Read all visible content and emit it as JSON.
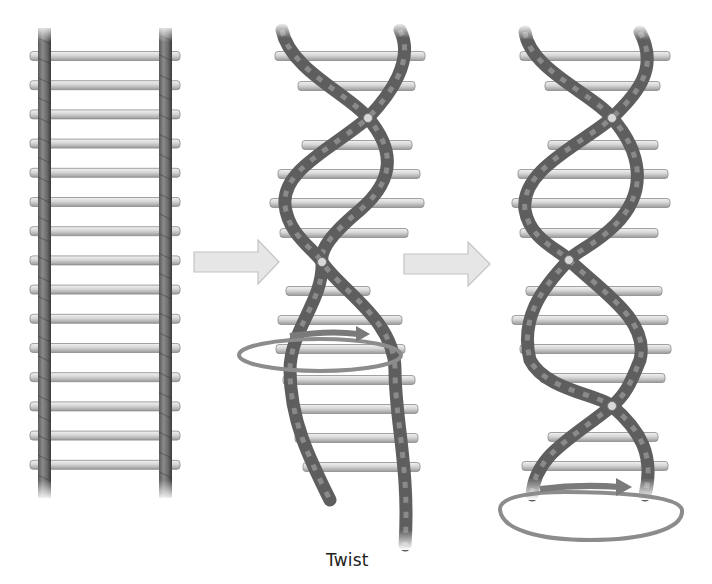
{
  "diagram": {
    "panels": [
      {
        "id": "ladder",
        "description": "Straight ladder with two rope-like rails and 15 rungs"
      },
      {
        "id": "twisting",
        "description": "Ladder being twisted; rotation arrow around middle",
        "label": "Twist"
      },
      {
        "id": "helix",
        "description": "Completed double helix with rotation arrow at base"
      }
    ],
    "arrows": [
      {
        "from": "ladder",
        "to": "twisting",
        "direction": "right"
      },
      {
        "from": "twisting",
        "to": "helix",
        "direction": "right"
      }
    ],
    "labels": {
      "twist": "Twist"
    },
    "colors": {
      "background": "#ffffff",
      "rail": "#6e6e6e",
      "rail_dark": "#3c3c3c",
      "rung": "#d4d4d4",
      "rung_edge": "#8a8a8a",
      "arrow_fill": "#e6e6e6",
      "arrow_edge": "#c4c4c4",
      "rotation_ring": "#8c8c8c",
      "text": "#222222"
    }
  }
}
